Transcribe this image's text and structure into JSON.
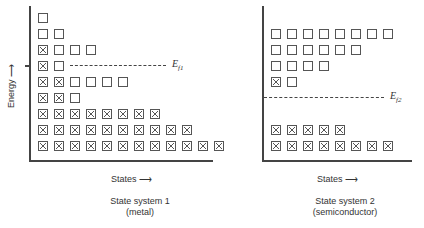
{
  "figure": {
    "panels": [
      {
        "id": "system1",
        "caption_line1": "State system 1",
        "caption_line2": "(metal)",
        "ylabel": "Energy ⟶",
        "xlabel": "States ⟶",
        "fermi_label": "E",
        "fermi_sub": "f1",
        "rows_top_to_bottom": [
          {
            "filled": 0,
            "empty": 1
          },
          {
            "filled": 0,
            "empty": 2
          },
          {
            "filled": 1,
            "empty": 3
          },
          {
            "filled": 1,
            "empty": 1,
            "fermi_level": true
          },
          {
            "filled": 2,
            "empty": 4
          },
          {
            "filled": 2,
            "empty": 1
          },
          {
            "filled": 8,
            "empty": 0
          },
          {
            "filled": 10,
            "empty": 0
          },
          {
            "filled": 12,
            "empty": 0
          }
        ]
      },
      {
        "id": "system2",
        "caption_line1": "State system 2",
        "caption_line2": "(semiconductor)",
        "xlabel": "States ⟶",
        "fermi_label": "E",
        "fermi_sub": "f2",
        "rows_top_to_bottom": [
          {
            "filled": 0,
            "empty": 8
          },
          {
            "filled": 0,
            "empty": 6
          },
          {
            "filled": 0,
            "empty": 4
          },
          {
            "filled": 1,
            "empty": 1
          },
          {
            "fermi_level": true
          },
          {
            "gap": true
          },
          {
            "filled": 5,
            "empty": 0
          },
          {
            "filled": 8,
            "empty": 0
          }
        ]
      }
    ],
    "legend": {
      "filled_box": "occupied state (⊠)",
      "empty_box": "unoccupied state (□)"
    }
  }
}
